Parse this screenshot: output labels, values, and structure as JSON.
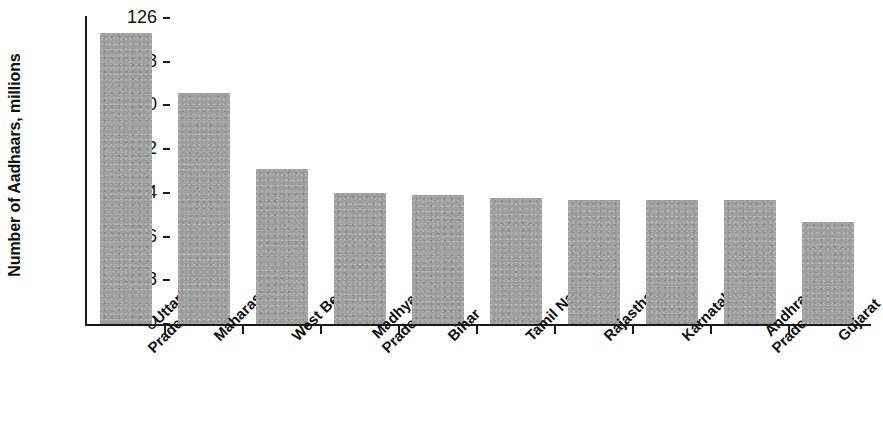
{
  "chart_data": {
    "type": "bar",
    "title": "",
    "xlabel": "",
    "ylabel": "Number of Aadhaars, millions",
    "categories": [
      "Uttar Pradesh",
      "Maharashtra",
      "West Bengal",
      "Madhya Pradesh",
      "Bihar",
      "Tamil Nadu",
      "Rajasthan",
      "Karnataka",
      "Andhra Pradesh",
      "Gujarat"
    ],
    "category_lines": [
      [
        "Uttar",
        "Pradesh"
      ],
      [
        "Maharashtra",
        ""
      ],
      [
        "West Bengal",
        ""
      ],
      [
        "Madhya",
        "Pradesh"
      ],
      [
        "Bihar",
        ""
      ],
      [
        "Tamil Nadu",
        ""
      ],
      [
        "Rajasthan",
        ""
      ],
      [
        "Karnataka",
        ""
      ],
      [
        "Andhra",
        "Pradesh"
      ],
      [
        "Gujarat",
        ""
      ]
    ],
    "values": [
      120,
      95,
      64,
      54,
      53,
      52,
      51,
      51,
      51,
      42
    ],
    "ylim": [
      0,
      126
    ],
    "yticks": [
      0,
      18,
      36,
      54,
      72,
      90,
      108,
      126
    ],
    "ytick_labels": [
      "0",
      "18",
      "36",
      "54",
      "72",
      "90",
      "108",
      "126"
    ],
    "grid": false,
    "legend": "none",
    "bar_color": "#9e9e9e",
    "axis_color": "#1a1a1a",
    "background": "#ffffff"
  }
}
